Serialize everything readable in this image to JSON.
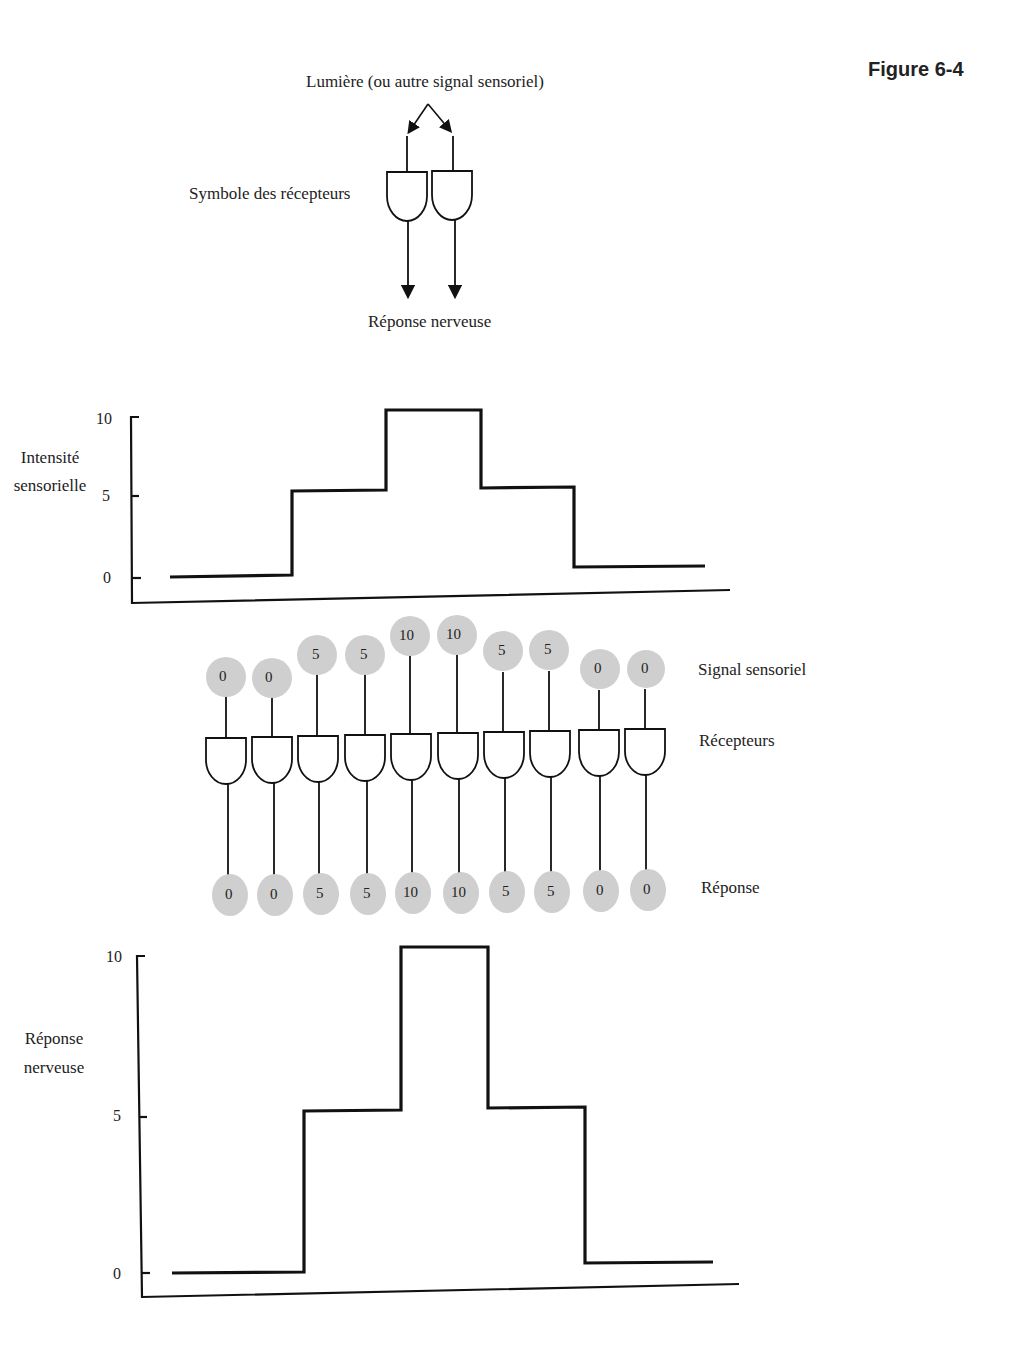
{
  "figure_label": "Figure 6-4",
  "top_diagram": {
    "light_label": "Lumière (ou autre signal sensoriel)",
    "receptor_symbol_label": "Symbole des récepteurs",
    "nerve_response_label": "Réponse nerveuse"
  },
  "array_diagram": {
    "signal_label": "Signal sensoriel",
    "receptors_label": "Récepteurs",
    "response_label": "Réponse",
    "signal_values": [
      "0",
      "0",
      "5",
      "5",
      "10",
      "10",
      "5",
      "5",
      "0",
      "0"
    ],
    "response_values": [
      "0",
      "0",
      "5",
      "5",
      "10",
      "10",
      "5",
      "5",
      "0",
      "0"
    ]
  },
  "colors": {
    "line": "#111111",
    "circle_fill": "#cfcfcf",
    "background": "#ffffff"
  },
  "chart_data": [
    {
      "type": "line",
      "step": true,
      "title": "",
      "ylabel": "Intensité sensorielle",
      "xlabel": "",
      "yticks": [
        "0",
        "5",
        "10"
      ],
      "ylim": [
        0,
        10
      ],
      "x": [
        1,
        2,
        3,
        4,
        5,
        6,
        7,
        8,
        9,
        10
      ],
      "values": [
        0,
        0,
        5,
        5,
        10,
        10,
        5,
        5,
        0,
        0
      ],
      "grid": false
    },
    {
      "type": "line",
      "step": true,
      "title": "",
      "ylabel": "Réponse nerveuse",
      "xlabel": "",
      "yticks": [
        "0",
        "5",
        "10"
      ],
      "ylim": [
        0,
        10
      ],
      "x": [
        1,
        2,
        3,
        4,
        5,
        6,
        7,
        8,
        9,
        10
      ],
      "values": [
        0,
        0,
        5,
        5,
        10,
        10,
        5,
        5,
        0,
        0
      ],
      "grid": false
    }
  ]
}
